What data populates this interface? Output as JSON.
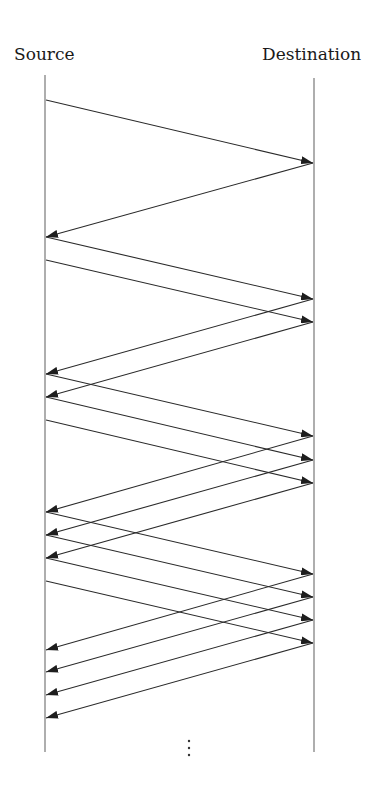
{
  "diagram": {
    "type": "sequence-timeline",
    "labels": {
      "source": "Source",
      "destination": "Destination"
    },
    "colors": {
      "lifeline": "#9a9a9a",
      "arrow": "#2a2a2a",
      "text": "#1a1a1a"
    },
    "lifelines": {
      "source": {
        "x": 45,
        "y_top": 75,
        "y_bottom": 752
      },
      "destination": {
        "x": 314,
        "y_top": 78,
        "y_bottom": 752
      }
    },
    "messages": [
      {
        "dir": "to-destination",
        "y_start": 100,
        "y_end": 163
      },
      {
        "dir": "to-source",
        "y_start": 163,
        "y_end": 237
      },
      {
        "dir": "to-destination",
        "y_start": 237,
        "y_end": 299
      },
      {
        "dir": "to-destination",
        "y_start": 260,
        "y_end": 322
      },
      {
        "dir": "to-source",
        "y_start": 299,
        "y_end": 374
      },
      {
        "dir": "to-source",
        "y_start": 322,
        "y_end": 397
      },
      {
        "dir": "to-destination",
        "y_start": 374,
        "y_end": 436
      },
      {
        "dir": "to-destination",
        "y_start": 397,
        "y_end": 460
      },
      {
        "dir": "to-destination",
        "y_start": 420,
        "y_end": 483
      },
      {
        "dir": "to-source",
        "y_start": 436,
        "y_end": 512
      },
      {
        "dir": "to-source",
        "y_start": 460,
        "y_end": 535
      },
      {
        "dir": "to-source",
        "y_start": 483,
        "y_end": 558
      },
      {
        "dir": "to-destination",
        "y_start": 512,
        "y_end": 574
      },
      {
        "dir": "to-destination",
        "y_start": 535,
        "y_end": 597
      },
      {
        "dir": "to-destination",
        "y_start": 558,
        "y_end": 620
      },
      {
        "dir": "to-destination",
        "y_start": 581,
        "y_end": 643
      },
      {
        "dir": "to-source",
        "y_start": 574,
        "y_end": 650
      },
      {
        "dir": "to-source",
        "y_start": 597,
        "y_end": 672
      },
      {
        "dir": "to-source",
        "y_start": 620,
        "y_end": 695
      },
      {
        "dir": "to-source",
        "y_start": 643,
        "y_end": 718
      }
    ],
    "continuation": {
      "symbol": "vertical-ellipsis",
      "x": 189,
      "y": [
        741,
        748,
        755
      ]
    }
  }
}
